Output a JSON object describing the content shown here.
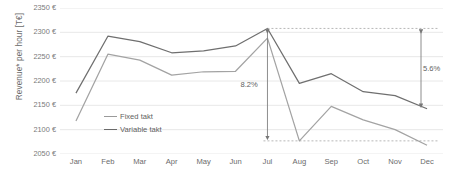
{
  "chart_data": {
    "type": "line",
    "title": "",
    "xlabel": "",
    "ylabel": "Revenue* per hour [T€]",
    "categories": [
      "Jan",
      "Feb",
      "Mar",
      "Apr",
      "May",
      "Jun",
      "Jul",
      "Aug",
      "Sep",
      "Oct",
      "Nov",
      "Dec"
    ],
    "ylim": [
      2050,
      2350
    ],
    "yticks": [
      "2350 €",
      "2300 €",
      "2250 €",
      "2200 €",
      "2150 €",
      "2100 €",
      "2050 €"
    ],
    "ytick_values": [
      2350,
      2300,
      2250,
      2200,
      2150,
      2100,
      2050
    ],
    "grid": true,
    "legend_position": "inside-left",
    "series": [
      {
        "name": "Fixed takt",
        "color": "#a3a3a3",
        "values": [
          2118,
          2255,
          2243,
          2212,
          2219,
          2220,
          2288,
          2077,
          2148,
          2120,
          2100,
          2068
        ]
      },
      {
        "name": "Variable takt",
        "color": "#6f6f6f",
        "values": [
          2175,
          2292,
          2281,
          2258,
          2262,
          2272,
          2308,
          2195,
          2215,
          2178,
          2170,
          2143
        ]
      }
    ],
    "annotations": [
      {
        "label": "8.2%",
        "x_category": "Jul",
        "type": "double-arrow-vertical",
        "from": 2308,
        "to": 2077
      },
      {
        "label": "5.6%",
        "x_category": "Dec",
        "type": "double-arrow-vertical",
        "from": 2308,
        "to": 2143
      }
    ]
  },
  "legend": {
    "items": [
      {
        "label": "Fixed takt"
      },
      {
        "label": "Variable takt"
      }
    ]
  }
}
